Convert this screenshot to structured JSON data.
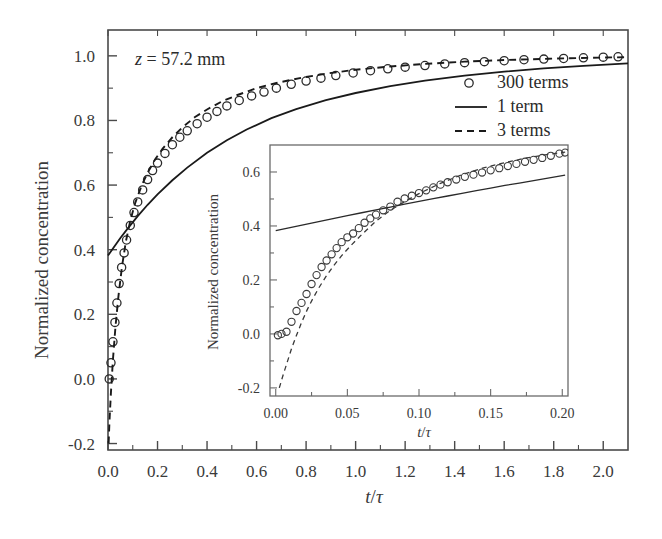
{
  "chart_data": {
    "type": "line",
    "title": "",
    "annotation": "z = 57.2 mm",
    "annotation_parts": {
      "symbol": "z",
      "rest": " = 57.2 mm"
    },
    "xlabel": "t/τ",
    "ylabel": "Normalized concentration",
    "xlim": [
      0.0,
      2.1
    ],
    "ylim": [
      -0.22,
      1.08
    ],
    "xticks": [
      "0.0",
      "0.2",
      "0.4",
      "0.6",
      "0.8",
      "1.0",
      "1.2",
      "1.4",
      "1.6",
      "1.8",
      "2.0"
    ],
    "xtick_values": [
      0.0,
      0.2,
      0.4,
      0.6,
      0.8,
      1.0,
      1.2,
      1.4,
      1.6,
      1.8,
      2.0
    ],
    "yticks": [
      "-0.2",
      "0.0",
      "0.2",
      "0.4",
      "0.6",
      "0.8",
      "1.0"
    ],
    "ytick_values": [
      -0.2,
      0.0,
      0.2,
      0.4,
      0.6,
      0.8,
      1.0
    ],
    "grid": false,
    "legend_position": "upper right",
    "legend": [
      {
        "label": "300 terms",
        "marker": "circle",
        "style": "markers"
      },
      {
        "label": "1 term",
        "marker": "none",
        "style": "solid"
      },
      {
        "label": "3 terms",
        "marker": "none",
        "style": "dashed"
      }
    ],
    "series": [
      {
        "name": "300 terms",
        "style": "markers",
        "x": [
          0.005,
          0.012,
          0.02,
          0.028,
          0.036,
          0.045,
          0.055,
          0.065,
          0.075,
          0.09,
          0.105,
          0.12,
          0.14,
          0.16,
          0.18,
          0.2,
          0.23,
          0.26,
          0.29,
          0.32,
          0.36,
          0.4,
          0.44,
          0.48,
          0.53,
          0.58,
          0.63,
          0.68,
          0.74,
          0.8,
          0.86,
          0.92,
          0.99,
          1.06,
          1.13,
          1.2,
          1.28,
          1.36,
          1.44,
          1.52,
          1.6,
          1.68,
          1.76,
          1.84,
          1.92,
          2.0,
          2.06
        ],
        "y": [
          0.0,
          0.05,
          0.115,
          0.175,
          0.235,
          0.295,
          0.345,
          0.39,
          0.43,
          0.475,
          0.515,
          0.548,
          0.585,
          0.617,
          0.645,
          0.668,
          0.698,
          0.725,
          0.748,
          0.768,
          0.79,
          0.81,
          0.828,
          0.845,
          0.862,
          0.876,
          0.888,
          0.9,
          0.912,
          0.922,
          0.931,
          0.939,
          0.947,
          0.954,
          0.96,
          0.965,
          0.97,
          0.975,
          0.979,
          0.982,
          0.985,
          0.988,
          0.99,
          0.992,
          0.994,
          0.996,
          0.997
        ]
      },
      {
        "name": "1 term",
        "style": "solid",
        "x": [
          0.0,
          0.02,
          0.05,
          0.08,
          0.12,
          0.16,
          0.2,
          0.26,
          0.32,
          0.4,
          0.48,
          0.56,
          0.66,
          0.76,
          0.88,
          1.0,
          1.14,
          1.28,
          1.44,
          1.6,
          1.76,
          1.92,
          2.1
        ],
        "y": [
          0.382,
          0.404,
          0.436,
          0.466,
          0.504,
          0.539,
          0.571,
          0.615,
          0.654,
          0.7,
          0.739,
          0.772,
          0.807,
          0.835,
          0.863,
          0.885,
          0.906,
          0.923,
          0.939,
          0.951,
          0.961,
          0.969,
          0.977
        ]
      },
      {
        "name": "3 terms",
        "style": "dashed",
        "x": [
          0.0025,
          0.006,
          0.012,
          0.02,
          0.03,
          0.042,
          0.056,
          0.072,
          0.09,
          0.11,
          0.135,
          0.16,
          0.19,
          0.22,
          0.26,
          0.3,
          0.35,
          0.4,
          0.46,
          0.52,
          0.6,
          0.68,
          0.78,
          0.88,
          1.0,
          1.14,
          1.28,
          1.44,
          1.6,
          1.78,
          1.95,
          2.1
        ],
        "y": [
          -0.2,
          -0.13,
          -0.04,
          0.06,
          0.16,
          0.255,
          0.345,
          0.425,
          0.49,
          0.545,
          0.597,
          0.638,
          0.679,
          0.712,
          0.748,
          0.778,
          0.81,
          0.834,
          0.859,
          0.878,
          0.9,
          0.916,
          0.932,
          0.945,
          0.957,
          0.967,
          0.975,
          0.982,
          0.987,
          0.991,
          0.994,
          0.996
        ]
      }
    ],
    "inset": {
      "xlabel": "t/τ",
      "ylabel": "Normalized concentration",
      "xlim": [
        -0.004,
        0.204
      ],
      "ylim": [
        -0.23,
        0.7
      ],
      "xticks": [
        "0.00",
        "0.05",
        "0.10",
        "0.15",
        "0.20"
      ],
      "xtick_values": [
        0.0,
        0.05,
        0.1,
        0.15,
        0.2
      ],
      "yticks": [
        "-0.2",
        "0.0",
        "0.2",
        "0.4",
        "0.6"
      ],
      "ytick_values": [
        -0.2,
        0.0,
        0.2,
        0.4,
        0.6
      ],
      "grid": false,
      "series": [
        {
          "name": "300 terms",
          "style": "markers",
          "x": [
            0.0015,
            0.004,
            0.0075,
            0.011,
            0.0145,
            0.018,
            0.0215,
            0.025,
            0.0285,
            0.032,
            0.0355,
            0.039,
            0.0425,
            0.046,
            0.05,
            0.054,
            0.058,
            0.062,
            0.066,
            0.07,
            0.075,
            0.08,
            0.085,
            0.09,
            0.095,
            0.1,
            0.105,
            0.11,
            0.115,
            0.12,
            0.126,
            0.132,
            0.138,
            0.144,
            0.15,
            0.156,
            0.162,
            0.168,
            0.174,
            0.18,
            0.186,
            0.192,
            0.198,
            0.202
          ],
          "y": [
            -0.005,
            0.0,
            0.008,
            0.045,
            0.085,
            0.115,
            0.148,
            0.185,
            0.218,
            0.248,
            0.272,
            0.295,
            0.318,
            0.34,
            0.358,
            0.372,
            0.392,
            0.412,
            0.428,
            0.442,
            0.458,
            0.472,
            0.49,
            0.502,
            0.512,
            0.522,
            0.532,
            0.543,
            0.553,
            0.562,
            0.572,
            0.582,
            0.59,
            0.598,
            0.606,
            0.614,
            0.622,
            0.63,
            0.638,
            0.645,
            0.652,
            0.66,
            0.668,
            0.672
          ]
        },
        {
          "name": "1 term",
          "style": "solid",
          "x": [
            0.0,
            0.01,
            0.02,
            0.03,
            0.04,
            0.05,
            0.06,
            0.07,
            0.08,
            0.09,
            0.1,
            0.11,
            0.12,
            0.13,
            0.14,
            0.15,
            0.16,
            0.17,
            0.18,
            0.19,
            0.202
          ],
          "y": [
            0.383,
            0.394,
            0.405,
            0.416,
            0.427,
            0.438,
            0.449,
            0.46,
            0.47,
            0.481,
            0.491,
            0.501,
            0.511,
            0.521,
            0.531,
            0.54,
            0.55,
            0.559,
            0.568,
            0.577,
            0.588
          ]
        },
        {
          "name": "3 terms",
          "style": "dashed",
          "x": [
            0.0025,
            0.005,
            0.008,
            0.011,
            0.0145,
            0.018,
            0.022,
            0.026,
            0.03,
            0.035,
            0.04,
            0.046,
            0.052,
            0.06,
            0.07,
            0.08,
            0.09,
            0.1,
            0.115,
            0.13,
            0.145,
            0.16,
            0.175,
            0.19,
            0.202
          ],
          "y": [
            -0.2,
            -0.155,
            -0.105,
            -0.055,
            -0.005,
            0.042,
            0.09,
            0.132,
            0.17,
            0.212,
            0.25,
            0.29,
            0.325,
            0.368,
            0.418,
            0.458,
            0.49,
            0.52,
            0.558,
            0.59,
            0.615,
            0.635,
            0.652,
            0.665,
            0.674
          ]
        }
      ]
    }
  }
}
